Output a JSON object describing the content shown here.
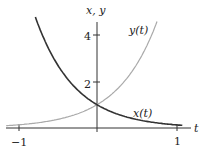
{
  "chart_data": {
    "type": "line",
    "title": "",
    "xlabel": "t",
    "ylabel": "x, y",
    "xlim": [
      -1.1,
      1.1
    ],
    "ylim": [
      0,
      4.6
    ],
    "x_ticks": [
      {
        "value": -1,
        "label": "−1"
      },
      {
        "value": 1,
        "label": "1"
      }
    ],
    "y_ticks": [
      {
        "value": 2,
        "label": "2"
      },
      {
        "value": 4,
        "label": "4"
      }
    ],
    "grid": false,
    "series": [
      {
        "name": "x(t)",
        "formula": "e^(-2t)",
        "color": "#333333",
        "x": [
          -0.75,
          -0.5,
          -0.25,
          0,
          0.25,
          0.5,
          0.75,
          1.0
        ],
        "values": [
          4.48,
          2.72,
          1.65,
          1.0,
          0.61,
          0.37,
          0.22,
          0.14
        ]
      },
      {
        "name": "y(t)",
        "formula": "e^(2t)",
        "color": "#aaaaaa",
        "x": [
          -1.0,
          -0.75,
          -0.5,
          -0.25,
          0,
          0.25,
          0.5,
          0.75
        ],
        "values": [
          0.14,
          0.22,
          0.37,
          0.61,
          1.0,
          1.65,
          2.72,
          4.48
        ]
      }
    ],
    "annotations": [
      {
        "text": "x(t)",
        "near_series": "x(t)"
      },
      {
        "text": "y(t)",
        "near_series": "y(t)"
      }
    ]
  },
  "labels": {
    "y_axis": "x, y",
    "x_axis": "t",
    "tick_neg1": "−1",
    "tick_1": "1",
    "tick_2": "2",
    "tick_4": "4",
    "curve_x": "x(t)",
    "curve_y": "y(t)"
  }
}
